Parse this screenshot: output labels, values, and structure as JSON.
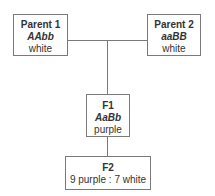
{
  "diagram": {
    "type": "genetic-cross-pedigree",
    "parent1": {
      "title": "Parent 1",
      "genotype": "AAbb",
      "phenotype": "white"
    },
    "parent2": {
      "title": "Parent 2",
      "genotype": "aaBB",
      "phenotype": "white"
    },
    "f1": {
      "title": "F1",
      "genotype": "AaBb",
      "phenotype": "purple"
    },
    "f2": {
      "title": "F2",
      "ratio": "9 purple : 7 white"
    },
    "colors": {
      "border": "#7a7a7a",
      "text": "#333333",
      "background": "#ffffff"
    }
  }
}
